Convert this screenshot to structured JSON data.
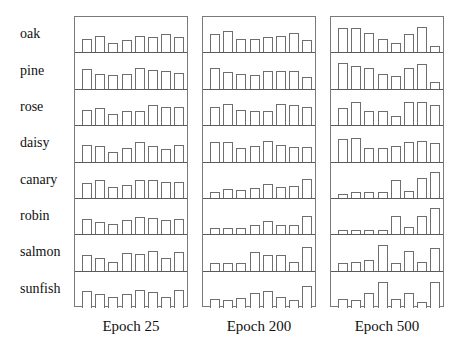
{
  "chart_data": {
    "type": "bar",
    "title": "",
    "layout": "small multiples grid: rows = items, columns = training epochs; each cell is an 8-bar activation pattern",
    "row_labels": [
      "oak",
      "pine",
      "rose",
      "daisy",
      "canary",
      "robin",
      "salmon",
      "sunfish"
    ],
    "column_labels": [
      "Epoch 25",
      "Epoch 200",
      "Epoch 500"
    ],
    "bars_per_cell": 8,
    "value_range": [
      0,
      1
    ],
    "grid": false,
    "legend": null,
    "panels": [
      {
        "name": "Epoch 25",
        "rows": {
          "oak": [
            0.45,
            0.55,
            0.3,
            0.42,
            0.55,
            0.52,
            0.6,
            0.5
          ],
          "pine": [
            0.65,
            0.5,
            0.45,
            0.48,
            0.7,
            0.62,
            0.6,
            0.52
          ],
          "rose": [
            0.5,
            0.58,
            0.37,
            0.45,
            0.48,
            0.65,
            0.6,
            0.6
          ],
          "daisy": [
            0.55,
            0.52,
            0.32,
            0.45,
            0.65,
            0.5,
            0.4,
            0.55
          ],
          "canary": [
            0.48,
            0.58,
            0.35,
            0.42,
            0.6,
            0.6,
            0.52,
            0.52
          ],
          "robin": [
            0.5,
            0.42,
            0.35,
            0.47,
            0.58,
            0.55,
            0.46,
            0.5
          ],
          "salmon": [
            0.5,
            0.42,
            0.3,
            0.57,
            0.55,
            0.65,
            0.4,
            0.6
          ],
          "sunfish": [
            0.55,
            0.45,
            0.35,
            0.47,
            0.58,
            0.52,
            0.35,
            0.6
          ]
        }
      },
      {
        "name": "Epoch 200",
        "rows": {
          "oak": [
            0.6,
            0.7,
            0.45,
            0.45,
            0.5,
            0.55,
            0.65,
            0.4
          ],
          "pine": [
            0.7,
            0.55,
            0.5,
            0.45,
            0.6,
            0.6,
            0.6,
            0.4
          ],
          "rose": [
            0.6,
            0.7,
            0.5,
            0.45,
            0.45,
            0.7,
            0.65,
            0.6
          ],
          "daisy": [
            0.65,
            0.65,
            0.45,
            0.5,
            0.68,
            0.55,
            0.47,
            0.47
          ],
          "canary": [
            0.2,
            0.3,
            0.27,
            0.32,
            0.45,
            0.35,
            0.4,
            0.62
          ],
          "robin": [
            0.2,
            0.2,
            0.22,
            0.3,
            0.45,
            0.3,
            0.3,
            0.6
          ],
          "salmon": [
            0.25,
            0.25,
            0.25,
            0.6,
            0.5,
            0.52,
            0.3,
            0.78
          ],
          "sunfish": [
            0.3,
            0.28,
            0.32,
            0.5,
            0.55,
            0.35,
            0.25,
            0.72
          ]
        }
      },
      {
        "name": "Epoch 500",
        "rows": {
          "oak": [
            0.8,
            0.8,
            0.65,
            0.45,
            0.3,
            0.6,
            0.82,
            0.2
          ],
          "pine": [
            0.85,
            0.75,
            0.7,
            0.48,
            0.42,
            0.68,
            0.8,
            0.22
          ],
          "rose": [
            0.55,
            0.75,
            0.45,
            0.45,
            0.3,
            0.75,
            0.75,
            0.65
          ],
          "daisy": [
            0.75,
            0.78,
            0.45,
            0.45,
            0.52,
            0.65,
            0.68,
            0.6
          ],
          "canary": [
            0.12,
            0.18,
            0.2,
            0.2,
            0.6,
            0.22,
            0.65,
            0.85
          ],
          "robin": [
            0.15,
            0.15,
            0.15,
            0.15,
            0.6,
            0.25,
            0.6,
            0.85
          ],
          "salmon": [
            0.25,
            0.3,
            0.35,
            0.85,
            0.25,
            0.65,
            0.28,
            0.75
          ],
          "sunfish": [
            0.3,
            0.25,
            0.5,
            0.85,
            0.3,
            0.5,
            0.2,
            0.85
          ]
        }
      }
    ]
  },
  "colors": {
    "background": "#ffffff",
    "bar_outline": "#6e6e6e",
    "bar_fill": "#ffffff",
    "panel_border": "#7a7a7a",
    "row_separator": "#5a5a5a",
    "text": "#111111"
  }
}
